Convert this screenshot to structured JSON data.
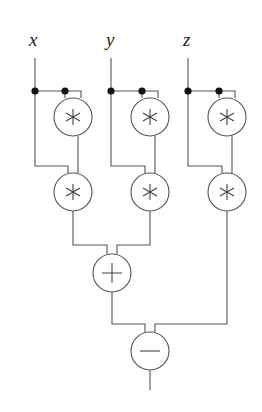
{
  "diagram": {
    "type": "arithmetic-circuit",
    "inputs": [
      {
        "id": "x",
        "label": "x",
        "x": 35
      },
      {
        "id": "y",
        "label": "y",
        "x": 111
      },
      {
        "id": "z",
        "label": "z",
        "x": 188
      }
    ],
    "gates": [
      {
        "id": "mx1",
        "op": "*",
        "symbol": "asterisk",
        "cx": 73,
        "cy": 117,
        "inputs": [
          "x",
          "x"
        ]
      },
      {
        "id": "mx2",
        "op": "*",
        "symbol": "asterisk",
        "cx": 73,
        "cy": 192,
        "inputs": [
          "x",
          "mx1"
        ]
      },
      {
        "id": "my1",
        "op": "*",
        "symbol": "asterisk",
        "cx": 150,
        "cy": 117,
        "inputs": [
          "y",
          "y"
        ]
      },
      {
        "id": "my2",
        "op": "*",
        "symbol": "asterisk",
        "cx": 150,
        "cy": 192,
        "inputs": [
          "y",
          "my1"
        ]
      },
      {
        "id": "mz1",
        "op": "*",
        "symbol": "asterisk",
        "cx": 227,
        "cy": 117,
        "inputs": [
          "z",
          "z"
        ]
      },
      {
        "id": "mz2",
        "op": "*",
        "symbol": "asterisk",
        "cx": 227,
        "cy": 192,
        "inputs": [
          "z",
          "mz1"
        ]
      },
      {
        "id": "add",
        "op": "+",
        "symbol": "plus",
        "cx": 112,
        "cy": 273,
        "inputs": [
          "mx2",
          "my2"
        ]
      },
      {
        "id": "sub",
        "op": "-",
        "symbol": "minus",
        "cx": 150,
        "cy": 351,
        "inputs": [
          "add",
          "mz2"
        ]
      }
    ],
    "output": {
      "from": "sub",
      "expression": "x^3 + y^3 - z^3"
    },
    "gate_radius": 19,
    "colors": {
      "wire": "#555555",
      "junction": "#111111",
      "label": "#222222"
    }
  }
}
